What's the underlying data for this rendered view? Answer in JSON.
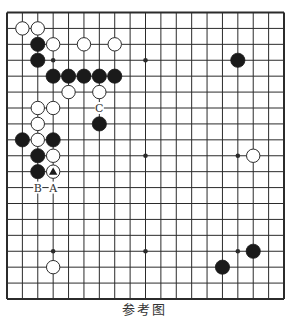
{
  "diagram": {
    "type": "go-board",
    "size": 19,
    "colors": {
      "line": "#2b2b2b",
      "black_stone": "#1a1a1a",
      "white_stone": "#ffffff",
      "background": "#ffffff"
    },
    "star_points": [
      [
        3,
        3
      ],
      [
        9,
        3
      ],
      [
        15,
        3
      ],
      [
        3,
        9
      ],
      [
        9,
        9
      ],
      [
        15,
        9
      ],
      [
        3,
        15
      ],
      [
        9,
        15
      ],
      [
        15,
        15
      ]
    ],
    "stones": {
      "white": [
        [
          1,
          1
        ],
        [
          2,
          1
        ],
        [
          3,
          2
        ],
        [
          5,
          2
        ],
        [
          7,
          2
        ],
        [
          4,
          5
        ],
        [
          6,
          5
        ],
        [
          2,
          6
        ],
        [
          3,
          6
        ],
        [
          2,
          7
        ],
        [
          2,
          8
        ],
        [
          3,
          9
        ],
        [
          3,
          10
        ],
        [
          16,
          9
        ],
        [
          3,
          16
        ]
      ],
      "black": [
        [
          2,
          2
        ],
        [
          2,
          3
        ],
        [
          3,
          4
        ],
        [
          4,
          4
        ],
        [
          5,
          4
        ],
        [
          6,
          4
        ],
        [
          7,
          4
        ],
        [
          6,
          7
        ],
        [
          1,
          8
        ],
        [
          3,
          8
        ],
        [
          2,
          9
        ],
        [
          2,
          10
        ],
        [
          15,
          3
        ],
        [
          16,
          15
        ],
        [
          14,
          16
        ]
      ]
    },
    "markers": [
      {
        "type": "triangle",
        "col": 3,
        "row": 10,
        "on": "white"
      }
    ],
    "labels": [
      {
        "text": "C",
        "col": 6,
        "row": 6
      },
      {
        "text": "B",
        "col": 2,
        "row": 11
      },
      {
        "text": "A",
        "col": 3,
        "row": 11
      }
    ]
  },
  "caption": "参考图"
}
